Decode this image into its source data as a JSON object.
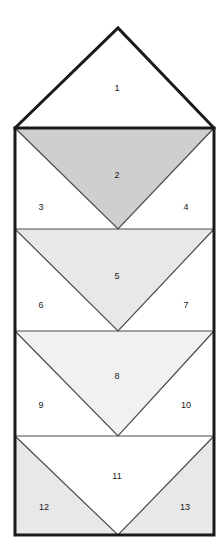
{
  "figure": {
    "canvas": {
      "width": 224,
      "height": 556
    },
    "background_color": "#ffffff",
    "stroke_color": "#1a1a1a",
    "outline_stroke_width": 3,
    "inner_stroke_width": 1.2,
    "geometry": {
      "apex_x": 118,
      "apex_y": 28,
      "left_x": 15,
      "right_x": 214,
      "row_boundaries": [
        128,
        229,
        331,
        436,
        535
      ]
    },
    "shades": {
      "white": "#ffffff",
      "very_light": "#f1f1f1",
      "light": "#e8e8e8",
      "medium": "#cfcfcf"
    },
    "regions": [
      {
        "id": "1",
        "label": "1",
        "shape": "apex-triangle",
        "fill": "#ffffff",
        "label_x": 117,
        "label_y": 89
      },
      {
        "id": "2",
        "label": "2",
        "shape": "down-triangle",
        "fill": "#cfcfcf",
        "label_x": 117,
        "label_y": 176
      },
      {
        "id": "3",
        "label": "3",
        "shape": "left-corner",
        "fill": "#ffffff",
        "label_x": 41,
        "label_y": 208
      },
      {
        "id": "4",
        "label": "4",
        "shape": "right-corner",
        "fill": "#ffffff",
        "label_x": 186,
        "label_y": 208
      },
      {
        "id": "5",
        "label": "5",
        "shape": "down-triangle",
        "fill": "#e8e8e8",
        "label_x": 117,
        "label_y": 277
      },
      {
        "id": "6",
        "label": "6",
        "shape": "left-corner",
        "fill": "#ffffff",
        "label_x": 41,
        "label_y": 306
      },
      {
        "id": "7",
        "label": "7",
        "shape": "right-corner",
        "fill": "#ffffff",
        "label_x": 186,
        "label_y": 306
      },
      {
        "id": "8",
        "label": "8",
        "shape": "down-triangle",
        "fill": "#f1f1f1",
        "label_x": 117,
        "label_y": 377
      },
      {
        "id": "9",
        "label": "9",
        "shape": "left-corner",
        "fill": "#ffffff",
        "label_x": 41,
        "label_y": 406
      },
      {
        "id": "10",
        "label": "10",
        "shape": "right-corner",
        "fill": "#ffffff",
        "label_x": 186,
        "label_y": 406
      },
      {
        "id": "11",
        "label": "11",
        "shape": "down-triangle",
        "fill": "#ffffff",
        "label_x": 117,
        "label_y": 477
      },
      {
        "id": "12",
        "label": "12",
        "shape": "left-corner",
        "fill": "#e8e8e8",
        "label_x": 44,
        "label_y": 508
      },
      {
        "id": "13",
        "label": "13",
        "shape": "right-corner",
        "fill": "#e8e8e8",
        "label_x": 185,
        "label_y": 508
      }
    ]
  }
}
